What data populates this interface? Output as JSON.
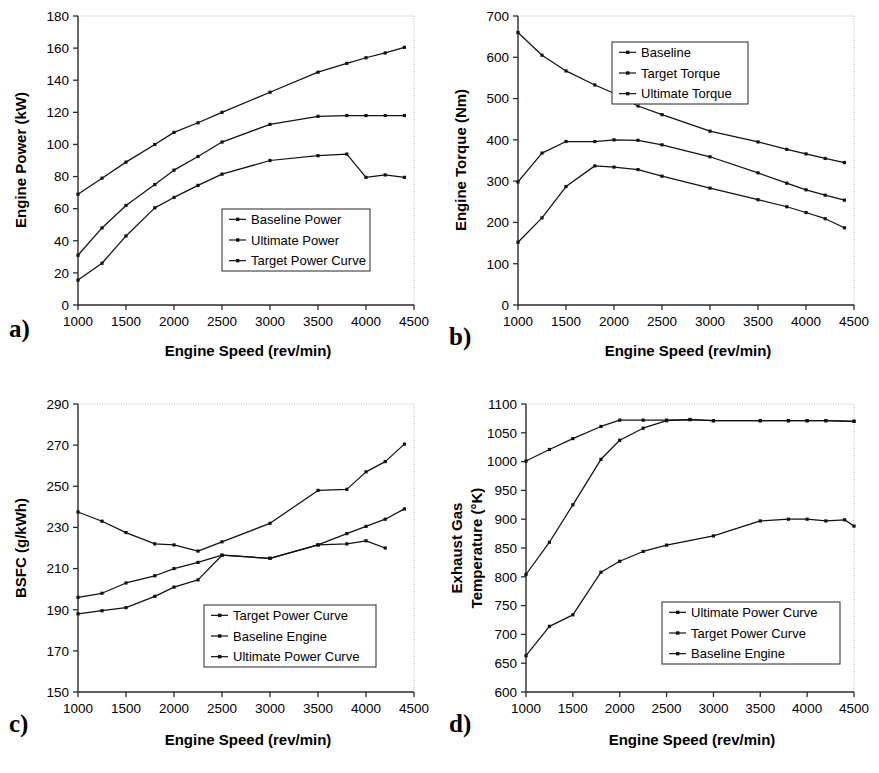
{
  "figure": {
    "panels": [
      "a)",
      "b)",
      "c)",
      "d)"
    ]
  },
  "chart_data": [
    {
      "id": "a",
      "panel_label": "a)",
      "type": "line",
      "title": "",
      "xlabel": "Engine Speed (rev/min)",
      "ylabel": "Engine Power (kW)",
      "xlim": [
        1000,
        4500
      ],
      "ylim": [
        0,
        180
      ],
      "xticks": [
        1000,
        1500,
        2000,
        2500,
        3000,
        3500,
        4000,
        4500
      ],
      "yticks": [
        0,
        20,
        40,
        60,
        80,
        100,
        120,
        140,
        160,
        180
      ],
      "grid": false,
      "legend_position": "inside-lower-right",
      "legend": [
        "Baseline Power",
        "Ultimate Power",
        "Target Power Curve"
      ],
      "series": [
        {
          "name": "Ultimate Power",
          "x": [
            1000,
            1250,
            1500,
            1800,
            2000,
            2250,
            2500,
            3000,
            3500,
            3800,
            4000,
            4200,
            4400
          ],
          "y": [
            69,
            79,
            89,
            100,
            107.5,
            113.5,
            120,
            132.5,
            145,
            150.5,
            154,
            157,
            160.5
          ]
        },
        {
          "name": "Target Power Curve",
          "x": [
            1000,
            1250,
            1500,
            1800,
            2000,
            2250,
            2500,
            3000,
            3500,
            3800,
            4000,
            4200,
            4400
          ],
          "y": [
            31,
            48,
            62,
            75,
            84,
            92.5,
            101.5,
            112.5,
            117.5,
            118,
            118,
            118,
            118
          ]
        },
        {
          "name": "Baseline Power",
          "x": [
            1000,
            1250,
            1500,
            1800,
            2000,
            2250,
            2500,
            3000,
            3500,
            3800,
            4000,
            4200,
            4400
          ],
          "y": [
            15.5,
            26,
            43,
            60.5,
            67,
            74.5,
            81.5,
            90,
            93,
            94,
            79.5,
            81,
            79.5
          ]
        }
      ]
    },
    {
      "id": "b",
      "panel_label": "b)",
      "type": "line",
      "title": "",
      "xlabel": "Engine Speed (rev/min)",
      "ylabel": "Engine Torque (Nm)",
      "xlim": [
        1000,
        4500
      ],
      "ylim": [
        0,
        700
      ],
      "xticks": [
        1000,
        1500,
        2000,
        2500,
        3000,
        3500,
        4000,
        4500
      ],
      "yticks": [
        0,
        100,
        200,
        300,
        400,
        500,
        600,
        700
      ],
      "grid": false,
      "legend_position": "inside-upper-right",
      "legend": [
        "Baseline",
        "Target Torque",
        "Ultimate Torque"
      ],
      "series": [
        {
          "name": "Ultimate Torque",
          "x": [
            1000,
            1250,
            1500,
            1800,
            2000,
            2250,
            2500,
            3000,
            3500,
            3800,
            4000,
            4200,
            4400
          ],
          "y": [
            660,
            605,
            567,
            533,
            513,
            482,
            461,
            421,
            395,
            377,
            366,
            355,
            345
          ]
        },
        {
          "name": "Target Torque",
          "x": [
            1000,
            1250,
            1500,
            1800,
            2000,
            2250,
            2500,
            3000,
            3500,
            3800,
            4000,
            4200,
            4400
          ],
          "y": [
            298,
            368,
            396,
            396,
            400,
            399,
            388,
            359,
            320,
            295,
            279,
            266,
            254
          ]
        },
        {
          "name": "Baseline",
          "x": [
            1000,
            1250,
            1500,
            1800,
            2000,
            2250,
            2500,
            3000,
            3500,
            3800,
            4000,
            4200,
            4400
          ],
          "y": [
            152,
            211,
            287,
            337,
            334,
            328,
            312,
            283,
            255,
            238,
            224,
            209,
            187
          ]
        }
      ]
    },
    {
      "id": "c",
      "panel_label": "c)",
      "type": "line",
      "title": "",
      "xlabel": "Engine Speed (rev/min)",
      "ylabel": "BSFC (g/kWh)",
      "xlim": [
        1000,
        4500
      ],
      "ylim": [
        150,
        290
      ],
      "xticks": [
        1000,
        1500,
        2000,
        2500,
        3000,
        3500,
        4000,
        4500
      ],
      "yticks": [
        150,
        170,
        190,
        210,
        230,
        250,
        270,
        290
      ],
      "grid": false,
      "legend_position": "inside-lower-right",
      "legend": [
        "Target Power Curve",
        "Baseline Engine",
        "Ultimate Power Curve"
      ],
      "series": [
        {
          "name": "Baseline Engine",
          "x": [
            1000,
            1250,
            1500,
            1800,
            2000,
            2250,
            2500,
            3000,
            3500,
            3800,
            4000,
            4200,
            4400
          ],
          "y": [
            237.5,
            233,
            227.5,
            222,
            221.5,
            218.5,
            223,
            232,
            248,
            248.5,
            257,
            262,
            270.5
          ]
        },
        {
          "name": "Target Power Curve",
          "x": [
            1000,
            1250,
            1500,
            1800,
            2000,
            2250,
            2500,
            3000,
            3500,
            3800,
            4000,
            4200,
            4400
          ],
          "y": [
            196,
            198,
            203,
            206.5,
            210,
            213,
            216.5,
            215,
            221.5,
            227,
            230.5,
            234,
            239
          ]
        },
        {
          "name": "Ultimate Power Curve",
          "x": [
            1000,
            1250,
            1500,
            1800,
            2000,
            2250,
            2500,
            3000,
            3500,
            3800,
            4000,
            4200
          ],
          "y": [
            188,
            189.5,
            191,
            196.5,
            201,
            204.5,
            216.5,
            215,
            221.5,
            222,
            223.5,
            220
          ]
        }
      ]
    },
    {
      "id": "d",
      "panel_label": "d)",
      "type": "line",
      "title": "",
      "xlabel": "Engine Speed (rev/min)",
      "ylabel": "Exhaust Gas Temperature (°K)",
      "ylabel_line1": "Exhaust Gas",
      "ylabel_line2": "Temperature (°K)",
      "xlim": [
        1000,
        4500
      ],
      "ylim": [
        600,
        1100
      ],
      "xticks": [
        1000,
        1500,
        2000,
        2500,
        3000,
        3500,
        4000,
        4500
      ],
      "yticks": [
        600,
        650,
        700,
        750,
        800,
        850,
        900,
        950,
        1000,
        1050,
        1100
      ],
      "grid": false,
      "legend_position": "inside-lower-right",
      "legend": [
        "Ultimate Power Curve",
        "Target Power Curve",
        "Baseline Engine"
      ],
      "series": [
        {
          "name": "Ultimate Power Curve",
          "x": [
            1000,
            1250,
            1500,
            1800,
            2000,
            2250,
            2500,
            2750,
            3000,
            3500,
            3800,
            4000,
            4200,
            4500
          ],
          "y": [
            1001,
            1021,
            1040,
            1061,
            1072,
            1072,
            1072,
            1073,
            1071,
            1071,
            1071,
            1071,
            1071,
            1070
          ]
        },
        {
          "name": "Target Power Curve",
          "x": [
            1000,
            1250,
            1500,
            1800,
            2000,
            2250,
            2500,
            2750,
            3000,
            3500,
            3800,
            4000,
            4200,
            4500
          ],
          "y": [
            804,
            860,
            925,
            1004,
            1037,
            1058,
            1071,
            1073,
            1071,
            1071,
            1071,
            1071,
            1071,
            1070
          ]
        },
        {
          "name": "Baseline Engine",
          "x": [
            1000,
            1250,
            1500,
            1800,
            2000,
            2250,
            2500,
            3000,
            3500,
            3800,
            4000,
            4200,
            4400,
            4500
          ],
          "y": [
            663,
            714,
            734,
            808,
            827,
            844,
            855,
            871,
            897,
            900,
            900,
            897,
            899,
            888
          ]
        }
      ]
    }
  ]
}
